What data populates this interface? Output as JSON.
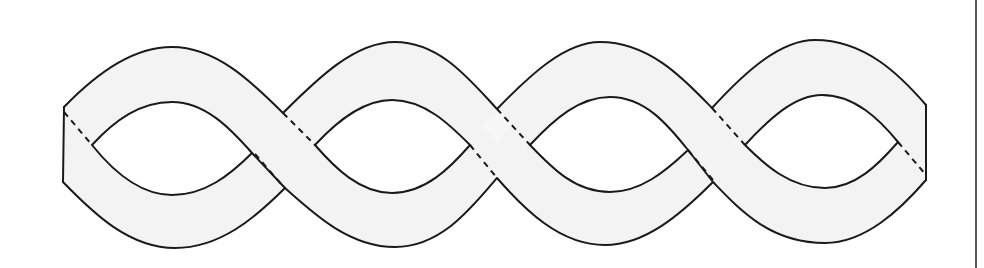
{
  "figure": {
    "description": "Line drawing of a twisted band forming four eye-shaped loops with three crossings; hidden edges shown dashed",
    "loops": 4,
    "crossings": 3,
    "colors": {
      "band_fill": "#f3f3f3",
      "outline": "#1a1a1a",
      "background": "#ffffff",
      "rule": "#222222"
    }
  }
}
